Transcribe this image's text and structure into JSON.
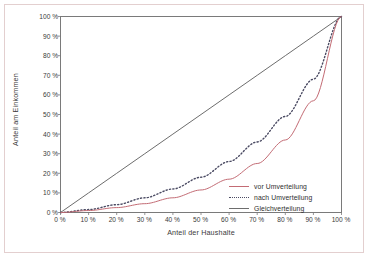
{
  "figure": {
    "background_color": "#ffffff",
    "frame_color": "#e3cfcf"
  },
  "chart_data": {
    "type": "line",
    "title": "",
    "subtitle": "",
    "xlabel": "Anteil der Haushalte",
    "ylabel": "Anteil am Einkommen",
    "xlim": [
      0,
      100
    ],
    "ylim": [
      0,
      100
    ],
    "grid": false,
    "legend_position": "inside-bottom-right",
    "x_tick_labels": [
      "0 %",
      "10 %",
      "20 %",
      "30 %",
      "40 %",
      "50 %",
      "60 %",
      "70 %",
      "80 %",
      "90 %",
      "100 %"
    ],
    "y_tick_labels": [
      "0 %",
      "10 %",
      "20 %",
      "30 %",
      "40 %",
      "50 %",
      "60 %",
      "70 %",
      "80 %",
      "90 %",
      "100 %"
    ],
    "x_ticks": [
      0,
      10,
      20,
      30,
      40,
      50,
      60,
      70,
      80,
      90,
      100
    ],
    "y_ticks": [
      0,
      10,
      20,
      30,
      40,
      50,
      60,
      70,
      80,
      90,
      100
    ],
    "x": [
      0,
      10,
      20,
      30,
      40,
      50,
      60,
      70,
      80,
      90,
      100
    ],
    "series": [
      {
        "name": "vor Umverteilung",
        "style": "solid",
        "color": "#c36b74",
        "values": [
          0,
          1,
          2.5,
          4.5,
          7.5,
          11.5,
          17,
          25,
          37,
          57,
          100
        ]
      },
      {
        "name": "nach Umverteilung",
        "style": "dotted",
        "color": "#4b4b63",
        "values": [
          0,
          1.5,
          4,
          7.5,
          12,
          18,
          26,
          36,
          49,
          68,
          100
        ]
      },
      {
        "name": "Gleichverteilung",
        "style": "solid",
        "color": "#6d6d6d",
        "values": [
          0,
          10,
          20,
          30,
          40,
          50,
          60,
          70,
          80,
          90,
          100
        ]
      }
    ]
  },
  "legend": {
    "items": [
      {
        "label": "vor Umverteilung",
        "swatch": "solid-red-line-icon"
      },
      {
        "label": "nach Umverteilung",
        "swatch": "dotted-line-icon"
      },
      {
        "label": "Gleichverteilung",
        "swatch": "solid-dark-line-icon"
      }
    ]
  }
}
